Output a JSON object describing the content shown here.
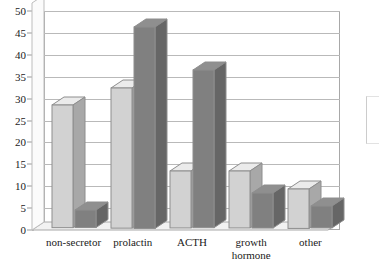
{
  "chart_data": {
    "type": "bar",
    "title": "",
    "subtitle": "",
    "xlabel": "",
    "ylabel": "",
    "categories": [
      "non-secretor",
      "prolactin",
      "ACTH",
      "growth hormone",
      "other"
    ],
    "series": [
      {
        "name": "series-1",
        "color": "#d2d2d2",
        "values": [
          28,
          32,
          13,
          13,
          9
        ]
      },
      {
        "name": "series-2",
        "color": "#808080",
        "values": [
          4,
          46,
          36,
          8,
          5
        ]
      }
    ],
    "ylim": [
      0,
      50
    ],
    "ytick_step": 5,
    "yticks": [
      0,
      5,
      10,
      15,
      20,
      25,
      30,
      35,
      40,
      45,
      50
    ],
    "ytick_labels": [
      "0",
      "5",
      "10",
      "15",
      "20",
      "25",
      "30",
      "35",
      "40",
      "45",
      "50"
    ],
    "grid": true,
    "grid_axis": "y",
    "legend_position": "right",
    "style": "3d-column",
    "background": "#ffffff"
  },
  "category_label_lines": [
    [
      "non-secretor"
    ],
    [
      "prolactin"
    ],
    [
      "ACTH"
    ],
    [
      "growth",
      "hormone"
    ],
    [
      "other"
    ]
  ]
}
